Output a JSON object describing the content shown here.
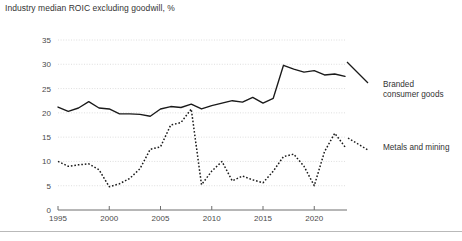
{
  "chart_title": "Industry median ROIC excluding goodwill, %",
  "axis": {
    "y_ticks": [
      0,
      5,
      10,
      15,
      20,
      25,
      30,
      35
    ],
    "x_ticks": [
      1995,
      2000,
      2005,
      2010,
      2015,
      2020
    ]
  },
  "legend": {
    "series1_line1": "Branded",
    "series1_line2": "consumer goods",
    "series2": "Metals and mining"
  },
  "colors": {
    "line": "#1a1a1a",
    "gridline": "#d6d6d6",
    "axis": "#6e6e6e",
    "text": "#333333",
    "rule": "#b9b9b9"
  },
  "chart_data": {
    "type": "line",
    "title": "Industry median ROIC excluding goodwill, %",
    "xlabel": "",
    "ylabel": "",
    "ylim": [
      0,
      35
    ],
    "xlim": [
      1995,
      2023
    ],
    "grid": true,
    "legend_position": "right",
    "x": [
      1995,
      1996,
      1997,
      1998,
      1999,
      2000,
      2001,
      2002,
      2003,
      2004,
      2005,
      2006,
      2007,
      2008,
      2009,
      2010,
      2011,
      2012,
      2013,
      2014,
      2015,
      2016,
      2017,
      2018,
      2019,
      2020,
      2021,
      2022,
      2023
    ],
    "series": [
      {
        "name": "Branded consumer goods",
        "style": "solid",
        "values": [
          21.2,
          20.3,
          21.0,
          22.3,
          21.0,
          20.8,
          19.8,
          19.8,
          19.7,
          19.3,
          20.8,
          21.3,
          21.1,
          21.8,
          20.8,
          21.5,
          22.0,
          22.5,
          22.2,
          23.2,
          22.0,
          23.0,
          29.8,
          29.0,
          28.4,
          28.7,
          27.8,
          28.0,
          27.5
        ]
      },
      {
        "name": "Metals and mining",
        "style": "dotted",
        "values": [
          10.0,
          9.0,
          9.3,
          9.5,
          8.3,
          4.8,
          5.4,
          6.5,
          8.5,
          12.5,
          13.0,
          17.5,
          18.0,
          20.8,
          5.2,
          8.0,
          10.0,
          6.0,
          7.0,
          6.2,
          5.6,
          8.0,
          11.0,
          11.5,
          9.0,
          5.0,
          12.0,
          15.8,
          13.0
        ]
      }
    ],
    "series2_post_break": {
      "note": "series values continue after 2009 crash",
      "values_2010_2023": [
        8.0,
        10.0,
        6.0,
        7.0,
        6.2,
        5.6,
        8.0,
        11.0,
        11.5,
        9.0,
        5.0,
        12.0,
        15.8,
        13.0
      ]
    }
  }
}
